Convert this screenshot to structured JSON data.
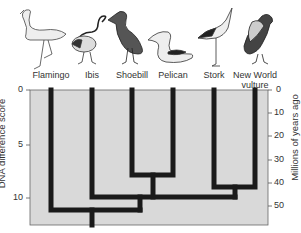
{
  "birds": [
    {
      "name": "Flamingo",
      "x": 51,
      "label_y": 70
    },
    {
      "name": "Ibis",
      "x": 92,
      "label_y": 70
    },
    {
      "name": "Shoebill",
      "x": 132,
      "label_y": 70
    },
    {
      "name": "Pelican",
      "x": 173,
      "label_y": 70
    },
    {
      "name": "Stork",
      "x": 214,
      "label_y": 70
    },
    {
      "name": "New World\nvulture",
      "x": 255,
      "label_y": 70
    }
  ],
  "left_axis": {
    "title": "DNA difference score",
    "ticks": [
      {
        "label": "0",
        "y": 90
      },
      {
        "label": "5",
        "y": 145
      },
      {
        "label": "10",
        "y": 198
      }
    ]
  },
  "right_axis": {
    "title": "Millions of years ago",
    "ticks": [
      {
        "label": "0",
        "y": 90
      },
      {
        "label": "10",
        "y": 113
      },
      {
        "label": "20",
        "y": 136
      },
      {
        "label": "30",
        "y": 160
      },
      {
        "label": "40",
        "y": 183
      },
      {
        "label": "50",
        "y": 206
      }
    ]
  },
  "tree": {
    "clades": [
      {
        "members": [
          "Shoebill",
          "Pelican"
        ],
        "join_dna": 8,
        "join_mya": 38
      },
      {
        "members": [
          "Stork",
          "New World vulture"
        ],
        "join_dna": 9,
        "join_mya": 42
      },
      {
        "members": [
          "Ibis",
          "Shoebill",
          "Pelican",
          "Stork",
          "New World vulture"
        ],
        "join_dna": 10,
        "join_mya": 46
      },
      {
        "members": [
          "Flamingo",
          "Ibis",
          "Shoebill",
          "Pelican",
          "Stork",
          "New World vulture"
        ],
        "join_dna": 11,
        "join_mya": 52
      }
    ]
  },
  "colors": {
    "plot_bg": "#d9d9d9",
    "branch": "#1a1a1a",
    "axis": "#555555"
  }
}
